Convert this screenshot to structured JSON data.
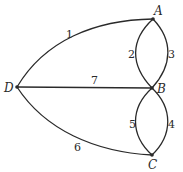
{
  "diagram": {
    "type": "multigraph",
    "nodes": [
      {
        "id": "A",
        "label": "A"
      },
      {
        "id": "B",
        "label": "B"
      },
      {
        "id": "C",
        "label": "C"
      },
      {
        "id": "D",
        "label": "D"
      }
    ],
    "edges": [
      {
        "id": "1",
        "label": "1",
        "from": "D",
        "to": "A"
      },
      {
        "id": "2",
        "label": "2",
        "from": "A",
        "to": "B"
      },
      {
        "id": "3",
        "label": "3",
        "from": "A",
        "to": "B"
      },
      {
        "id": "4",
        "label": "4",
        "from": "B",
        "to": "C"
      },
      {
        "id": "5",
        "label": "5",
        "from": "B",
        "to": "C"
      },
      {
        "id": "6",
        "label": "6",
        "from": "D",
        "to": "C"
      },
      {
        "id": "7",
        "label": "7",
        "from": "D",
        "to": "B"
      }
    ]
  }
}
